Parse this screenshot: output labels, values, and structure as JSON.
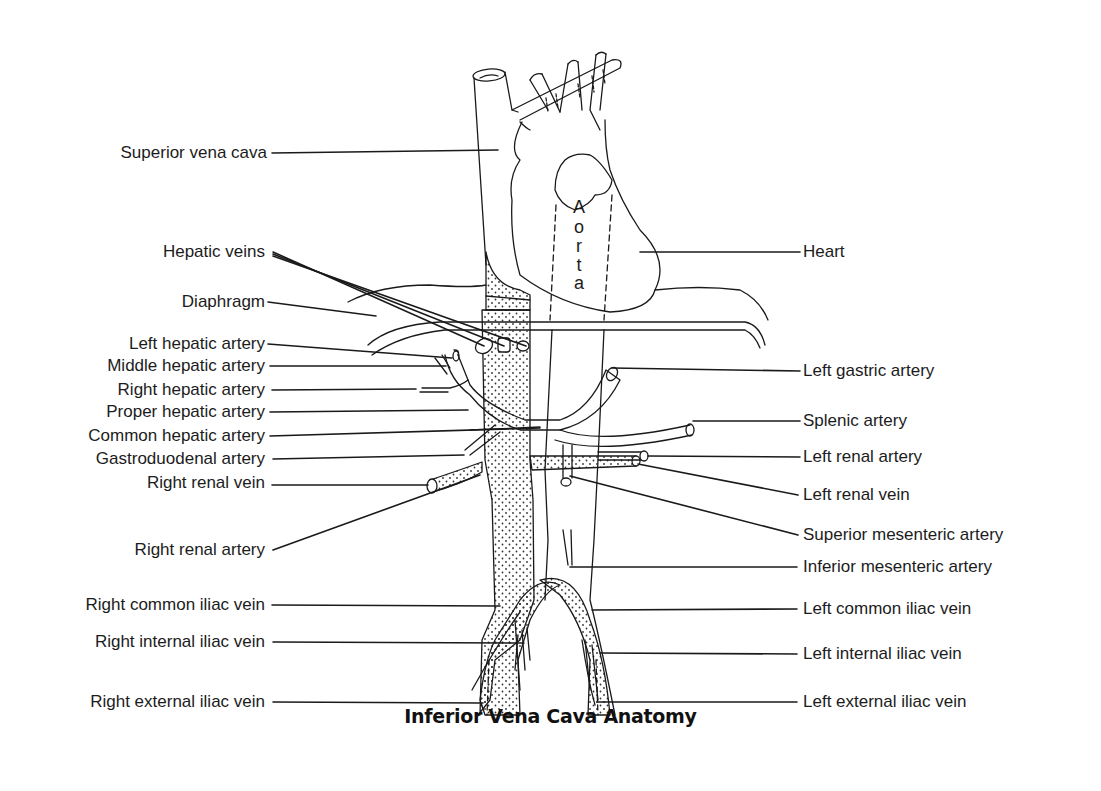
{
  "title": "Inferior Vena Cava Anatomy",
  "structure_label": {
    "aorta_letters": [
      "A",
      "o",
      "r",
      "t",
      "a"
    ]
  },
  "labels_left": [
    {
      "text": "Superior vena cava",
      "y": 153
    },
    {
      "text": "Hepatic veins",
      "y": 252
    },
    {
      "text": "Diaphragm",
      "y": 302
    },
    {
      "text": "Left hepatic artery",
      "y": 344
    },
    {
      "text": "Middle hepatic artery",
      "y": 366
    },
    {
      "text": "Right hepatic artery",
      "y": 390
    },
    {
      "text": "Proper hepatic artery",
      "y": 412
    },
    {
      "text": "Common hepatic artery",
      "y": 436
    },
    {
      "text": "Gastroduodenal artery",
      "y": 459
    },
    {
      "text": "Right renal vein",
      "y": 483
    },
    {
      "text": "Right renal artery",
      "y": 550
    },
    {
      "text": "Right common iliac vein",
      "y": 605
    },
    {
      "text": "Right internal iliac vein",
      "y": 642
    },
    {
      "text": "Right external iliac vein",
      "y": 702
    }
  ],
  "labels_right": [
    {
      "text": "Heart",
      "y": 252
    },
    {
      "text": "Left gastric artery",
      "y": 371
    },
    {
      "text": "Splenic artery",
      "y": 421
    },
    {
      "text": "Left renal artery",
      "y": 457
    },
    {
      "text": "Left renal vein",
      "y": 495
    },
    {
      "text": "Superior mesenteric artery",
      "y": 535
    },
    {
      "text": "Inferior mesenteric artery",
      "y": 567
    },
    {
      "text": "Left common iliac vein",
      "y": 609
    },
    {
      "text": "Left internal iliac vein",
      "y": 654
    },
    {
      "text": "Left external iliac vein",
      "y": 702
    }
  ],
  "colors": {
    "line": "#1a1a1a",
    "background": "#ffffff",
    "stipple": "#333333"
  }
}
